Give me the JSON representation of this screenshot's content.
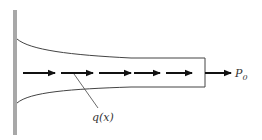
{
  "diagram": {
    "labels": {
      "distributed_load": "q(x)",
      "end_load_main": "P",
      "end_load_sub": "0"
    },
    "colors": {
      "wall": "#a8a8a8",
      "outline": "#444444",
      "arrow": "#111111"
    },
    "arrow_count": 5
  }
}
